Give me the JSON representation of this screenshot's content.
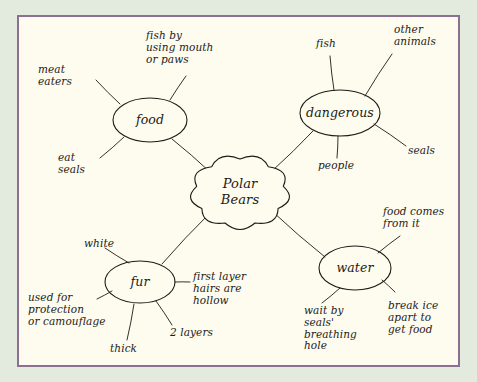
{
  "poster": {
    "outer_background": "#e3ebdf",
    "sheet_background": "#fdfcef",
    "border_color": "#8d6f91",
    "ink_color": "#1d1a17"
  },
  "chart_data": {
    "type": "diagram",
    "diagram_kind": "mind-map",
    "title": "Polar Bears",
    "center": {
      "id": "polar-bears",
      "label": "Polar\nBears",
      "shape": "cloud",
      "x": 240,
      "y": 192,
      "rx": 44,
      "ry": 33
    },
    "branches": [
      {
        "id": "food",
        "label": "food",
        "shape": "ellipse",
        "x": 150,
        "y": 120,
        "rx": 37,
        "ry": 22,
        "leaves": [
          {
            "id": "meat-eaters",
            "label": "meat\neaters",
            "x": 38,
            "y": 64,
            "align": "left",
            "line_from": [
              96,
              80
            ],
            "line_to": [
              120,
              104
            ]
          },
          {
            "id": "fish-by-using-mouth-or-paws",
            "label": "fish by\nusing mouth\nor paws",
            "x": 146,
            "y": 30,
            "align": "left",
            "line_from": [
              186,
              76
            ],
            "line_to": [
              170,
              100
            ]
          },
          {
            "id": "eat-seals",
            "label": "eat\nseals",
            "x": 58,
            "y": 152,
            "align": "left",
            "line_from": [
              100,
              158
            ],
            "line_to": [
              124,
              137
            ]
          }
        ]
      },
      {
        "id": "dangerous",
        "label": "dangerous",
        "shape": "ellipse",
        "x": 340,
        "y": 113,
        "rx": 40,
        "ry": 23,
        "leaves": [
          {
            "id": "fish",
            "label": "fish",
            "x": 316,
            "y": 38,
            "align": "left",
            "line_from": [
              330,
              56
            ],
            "line_to": [
              334,
              90
            ]
          },
          {
            "id": "other-animals",
            "label": "other\nanimals",
            "x": 394,
            "y": 24,
            "align": "left",
            "line_from": [
              392,
              54
            ],
            "line_to": [
              365,
              96
            ]
          },
          {
            "id": "people",
            "label": "people",
            "x": 318,
            "y": 160,
            "align": "left",
            "line_from": [
              337,
              158
            ],
            "line_to": [
              338,
              136
            ]
          },
          {
            "id": "seals",
            "label": "seals",
            "x": 408,
            "y": 145,
            "align": "left",
            "line_from": [
              406,
              146
            ],
            "line_to": [
              374,
              124
            ]
          }
        ]
      },
      {
        "id": "fur",
        "label": "fur",
        "shape": "ellipse",
        "x": 140,
        "y": 282,
        "rx": 35,
        "ry": 21,
        "leaves": [
          {
            "id": "white",
            "label": "white",
            "x": 84,
            "y": 238,
            "align": "left",
            "line_from": [
              105,
              248
            ],
            "line_to": [
              129,
              263
            ]
          },
          {
            "id": "used-for-protection-or-camouflage",
            "label": "used for\nprotection\nor camouflage",
            "x": 28,
            "y": 292,
            "align": "left",
            "line_from": [
              97,
              299
            ],
            "line_to": [
              112,
              291
            ]
          },
          {
            "id": "first-layer-hairs-are-hollow",
            "label": "first layer\nhairs are\nhollow",
            "x": 193,
            "y": 271,
            "align": "left",
            "line_from": [
              190,
              282
            ],
            "line_to": [
              175,
              282
            ]
          },
          {
            "id": "2-layers",
            "label": "2 layers",
            "x": 170,
            "y": 327,
            "align": "left",
            "line_from": [
              172,
              325
            ],
            "line_to": [
              156,
              301
            ]
          },
          {
            "id": "thick",
            "label": "thick",
            "x": 110,
            "y": 343,
            "align": "left",
            "line_from": [
              127,
              340
            ],
            "line_to": [
              134,
              304
            ]
          }
        ]
      },
      {
        "id": "water",
        "label": "water",
        "shape": "ellipse",
        "x": 355,
        "y": 268,
        "rx": 36,
        "ry": 22,
        "leaves": [
          {
            "id": "food-comes-from-it",
            "label": "food comes\nfrom it",
            "x": 383,
            "y": 206,
            "align": "left",
            "line_from": [
              400,
              236
            ],
            "line_to": [
              378,
              253
            ]
          },
          {
            "id": "wait-by-seals-breathing-hole",
            "label": "wait by\nseals'\nbreathing\nhole",
            "x": 304,
            "y": 305,
            "align": "left",
            "line_from": [
              322,
              303
            ],
            "line_to": [
              340,
              288
            ]
          },
          {
            "id": "break-ice-apart-to-get-food",
            "label": "break ice\napart to\nget food",
            "x": 388,
            "y": 300,
            "align": "left",
            "line_from": [
              395,
              292
            ],
            "line_to": [
              382,
              280
            ]
          }
        ]
      }
    ],
    "center_links": [
      {
        "id": "center-to-food",
        "from": [
          210,
          172
        ],
        "to": [
          172,
          139
        ]
      },
      {
        "id": "center-to-dangerous",
        "from": [
          272,
          171
        ],
        "to": [
          313,
          131
        ]
      },
      {
        "id": "center-to-fur",
        "from": [
          210,
          213
        ],
        "to": [
          162,
          264
        ]
      },
      {
        "id": "center-to-water",
        "from": [
          273,
          212
        ],
        "to": [
          325,
          257
        ]
      }
    ]
  }
}
